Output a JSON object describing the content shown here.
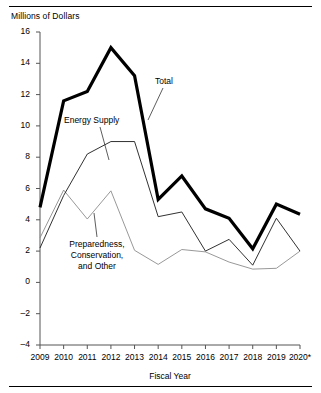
{
  "figure": {
    "y_axis_title": "Millions of Dollars",
    "x_axis_title": "Fiscal Year",
    "rules": {
      "top": "horizontal-rule",
      "bottom": "horizontal-rule"
    }
  },
  "annotations": [
    {
      "id": "total",
      "label": "Total"
    },
    {
      "id": "energy-supply",
      "label": "Energy Supply"
    },
    {
      "id": "preparedness",
      "line1": "Preparedness,",
      "line2": "Conservation,",
      "line3": "and Other"
    }
  ],
  "chart_data": {
    "type": "line",
    "title": "",
    "subtitle": "",
    "xlabel": "Fiscal Year",
    "ylabel": "Millions of Dollars",
    "grid": false,
    "legend_position": "inline-annotations",
    "xlim": [
      2009,
      2020
    ],
    "ylim": [
      -4,
      16
    ],
    "yticks": [
      16,
      14,
      12,
      10,
      8,
      6,
      4,
      2,
      0,
      -2,
      -4
    ],
    "ytick_labels": [
      "16",
      "14",
      "12",
      "10",
      "8",
      "6",
      "4",
      "2",
      "0",
      "–2",
      "–4"
    ],
    "categories": [
      "2009",
      "2010",
      "2011",
      "2012",
      "2013",
      "2014",
      "2015",
      "2016",
      "2017",
      "2018",
      "2019",
      "2020*"
    ],
    "xtick_labels": [
      "2009",
      "2010",
      "2011",
      "2012",
      "2013",
      "2014",
      "2015",
      "2016",
      "2017",
      "2018",
      "2019",
      "2020*"
    ],
    "series": [
      {
        "name": "Total",
        "style": "thick-black",
        "color": "#000000",
        "width": 3.2,
        "values": [
          4.8,
          11.6,
          12.2,
          15.0,
          13.2,
          5.3,
          6.8,
          4.7,
          4.1,
          2.15,
          5.0,
          4.35
        ]
      },
      {
        "name": "Energy Supply",
        "style": "thin-black",
        "color": "#1a1a1a",
        "width": 0.9,
        "values": [
          2.2,
          5.55,
          8.2,
          9.0,
          9.0,
          4.2,
          4.5,
          2.0,
          2.75,
          1.1,
          4.1,
          2.0
        ]
      },
      {
        "name": "Preparedness, Conservation, and Other",
        "style": "thin-gray",
        "color": "#8c8c8c",
        "width": 0.9,
        "values": [
          2.85,
          5.9,
          4.05,
          5.85,
          2.05,
          1.15,
          2.1,
          1.95,
          1.3,
          0.85,
          0.9,
          2.0
        ]
      }
    ],
    "annotation_labels": [
      "Total",
      "Energy Supply",
      "Preparedness, Conservation, and Other"
    ]
  }
}
